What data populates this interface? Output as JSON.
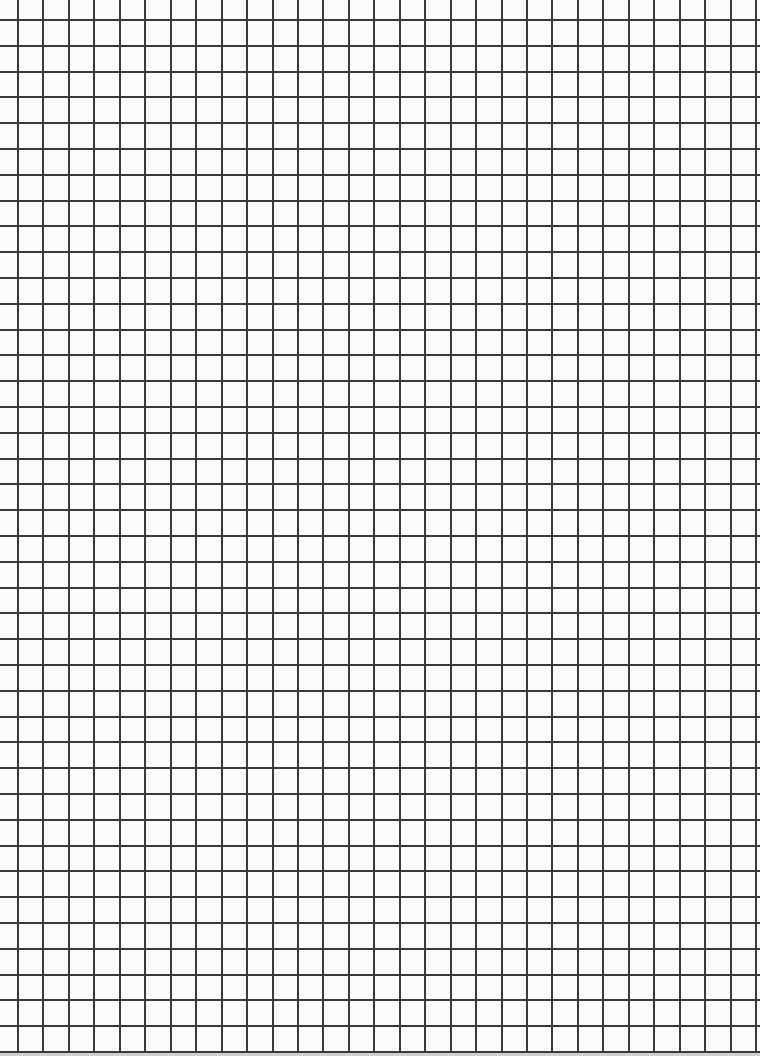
{
  "page": {
    "type": "grid-paper",
    "background_color": "#fbfbfb",
    "line_color": "#3a3a3a",
    "line_width_px": 2
  },
  "grid": {
    "vertical_lines": {
      "count": 30,
      "first_px": 18,
      "spacing_px": 25.45
    },
    "horizontal_lines": {
      "count": 41,
      "first_px": 20,
      "spacing_px": 25.8
    }
  }
}
